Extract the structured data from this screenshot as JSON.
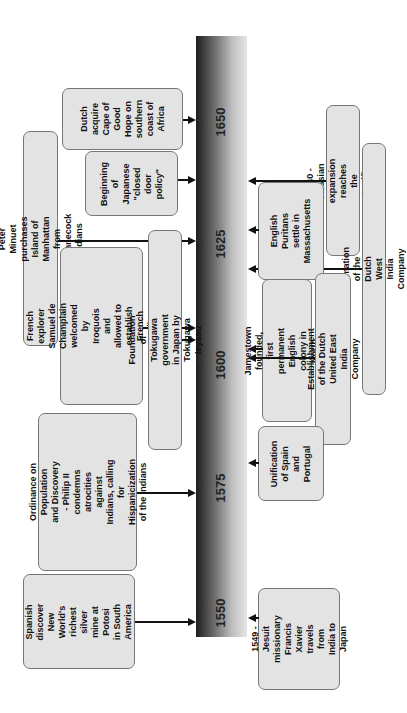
{
  "timeline": {
    "years": [
      {
        "label": "1650"
      },
      {
        "label": "1625"
      },
      {
        "label": "1600"
      },
      {
        "label": "1575"
      },
      {
        "label": "1550"
      }
    ]
  },
  "events_left": [
    {
      "id": "dutch-cape",
      "text": "Dutch\nacquire\nCape of\nGood\nHope on\nsouthern\ncoast of\nAfrica"
    },
    {
      "id": "japanese-closed-door",
      "text": "Beginning\nof\nJapanese\n\"closed\ndoor\npolicy\""
    },
    {
      "id": "peter-minuet",
      "text": "Peter Minuet purchases Island of\nManhattan from Shinnecock Indians"
    },
    {
      "id": "champlain",
      "text": "French explorer Samuel de\nChamplain welcomed by\nIroquois and allowed to\nestablish French trading\npost at Quebec"
    },
    {
      "id": "tokugawa",
      "text": "Foundation of Tokugawa government\nin Japan by Tokugawa Ieyasu"
    },
    {
      "id": "ordinance",
      "text": "Ordinance on Population\nand Discovery - Philip II\ncondemns atrocities\nagainst Indians, calling\nfor Hispanicization\nof the Indians"
    },
    {
      "id": "potosi",
      "text": "Spanish\ndiscover New\nWorld's\nrichest silver\nmine at Potosi\nin South\nAmerica"
    }
  ],
  "events_right": [
    {
      "id": "russian-expansion",
      "text": "1640 - Russian expansion\nreaches the Pacific coast"
    },
    {
      "id": "dutch-west-india",
      "text": "Formation of the Dutch West India Company"
    },
    {
      "id": "english-puritans",
      "text": "English\nPuritans\nsettle in\nMassachusetts"
    },
    {
      "id": "jamestown",
      "text": "Jamestown founded,\nfirst permanent English\ncolony in North America"
    },
    {
      "id": "dutch-east-india",
      "text": "Establishment of the Dutch\nUnited East India Company"
    },
    {
      "id": "spain-portugal",
      "text": "Unification\nof Spain\nand\nPortugal"
    },
    {
      "id": "xavier",
      "text": "1549 - Jesuit\nmissionary\nFrancis Xavier\ntravels from\nIndia to Japan"
    }
  ],
  "colors": {
    "box_fill": "#e3e3e3",
    "box_border": "#777777",
    "bar_dark": "#1e1e1e",
    "bar_light": "#e6e6e6",
    "connector": "#111111"
  }
}
